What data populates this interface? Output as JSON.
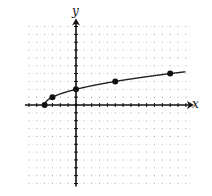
{
  "chart_data": {
    "type": "line",
    "title": "",
    "xlabel": "x",
    "ylabel": "y",
    "xlim": [
      -6,
      14
    ],
    "ylim": [
      -10,
      10
    ],
    "grid": "dotted",
    "legend": null,
    "function": "y = sqrt(x + 4)",
    "series": [
      {
        "name": "curve",
        "points": [
          [
            -4,
            0
          ],
          [
            -3,
            1
          ],
          [
            0,
            2
          ],
          [
            5,
            3
          ],
          [
            12,
            4
          ]
        ],
        "curve_extends_to_x": 14
      }
    ],
    "marked_points": [
      [
        -4,
        0
      ],
      [
        -3,
        1
      ],
      [
        0,
        2
      ],
      [
        5,
        3
      ],
      [
        12,
        4
      ]
    ]
  },
  "labels": {
    "x": "x",
    "y": "y"
  },
  "colors": {
    "axis": "#111111",
    "curve": "#222222",
    "grid": "#9a9a9a",
    "point": "#111111"
  }
}
